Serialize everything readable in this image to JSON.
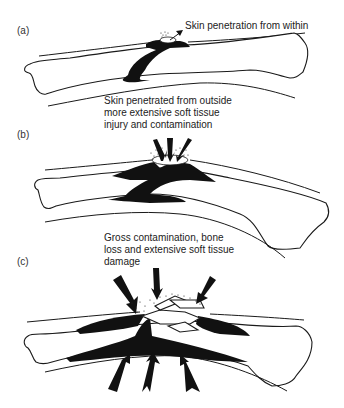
{
  "figure": {
    "panels": [
      {
        "id": "a",
        "label": "(a)",
        "caption": [
          "Skin penetration from within"
        ],
        "description": "Bone fragment pierces skin from inside outward"
      },
      {
        "id": "b",
        "label": "(b)",
        "caption": [
          "Skin penetrated from outside",
          "more extensive soft tissue",
          "injury and contamination"
        ],
        "description": "Three arrows pointing down into wound with contamination dots"
      },
      {
        "id": "c",
        "label": "(c)",
        "caption": [
          "Gross contamination, bone",
          "loss and extensive soft tissue",
          "damage"
        ],
        "description": "Comminuted fracture with arrows from above and below"
      }
    ],
    "colors": {
      "ink": "#111111",
      "background": "#ffffff",
      "text": "#222222"
    }
  }
}
